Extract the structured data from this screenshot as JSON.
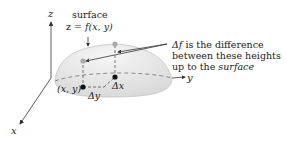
{
  "figure": {
    "axes": {
      "z_label": "z",
      "y_label": "y",
      "x_label": "x"
    },
    "surface_label": {
      "line1": "surface",
      "line2_prefix": "z = ",
      "line2_func": "f(x, y)"
    },
    "annotation": {
      "line1_sym": "Δf",
      "line1_rest": " is the difference",
      "line2": "between these heights",
      "line3_prefix": "up to the ",
      "line3_ital": "surface"
    },
    "point_label": "(x, y)",
    "delta_x_label": "Δx",
    "delta_y_label": "Δy",
    "colors": {
      "dome_fill": "#e4e4e4",
      "dome_edge": "#bdbdbd",
      "dashed": "#888888",
      "points": "#111111",
      "surface_points": "#a8a8a8",
      "axes": "#333333"
    }
  }
}
